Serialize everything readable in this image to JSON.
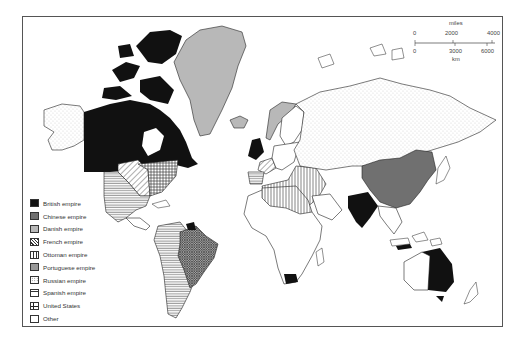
{
  "map": {
    "title": "",
    "theme": "World empires",
    "colors": {
      "british": "#111111",
      "chinese": "#707070",
      "danish": "#b8b8b8",
      "outline": "#222222",
      "background": "#ffffff",
      "frame": "#555555"
    }
  },
  "legend": {
    "items": [
      {
        "label": "British empire",
        "pattern": "solid-black"
      },
      {
        "label": "Chinese empire",
        "pattern": "solid-dark-gray"
      },
      {
        "label": "Danish empire",
        "pattern": "solid-light-gray"
      },
      {
        "label": "French empire",
        "pattern": "diagonal-hatch"
      },
      {
        "label": "Ottoman empire",
        "pattern": "vertical-lines"
      },
      {
        "label": "Portuguese empire",
        "pattern": "cross-hatch-dense"
      },
      {
        "label": "Russian empire",
        "pattern": "dotted"
      },
      {
        "label": "Spanish empire",
        "pattern": "horizontal-lines"
      },
      {
        "label": "United States",
        "pattern": "grid"
      },
      {
        "label": "Other",
        "pattern": "blank"
      }
    ]
  },
  "scale_bar": {
    "miles_label": "miles",
    "miles_ticks": [
      "0",
      "2000",
      "4000"
    ],
    "km_ticks": [
      "0",
      "3000",
      "6000"
    ],
    "km_label": "km"
  }
}
